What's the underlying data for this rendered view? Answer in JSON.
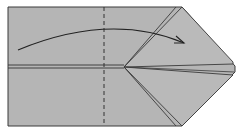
{
  "diagram": {
    "type": "origami-fold-step",
    "background": "#ffffff",
    "paper_color": "#b4b4b4",
    "line_color": "#333333",
    "instruction": "valley fold left edge over to the right along dashed line"
  }
}
